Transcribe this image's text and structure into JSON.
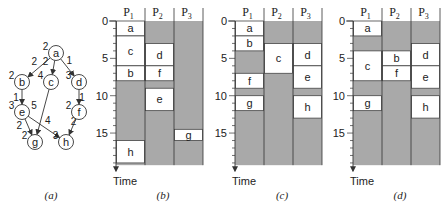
{
  "graph": {
    "caption": "(a)",
    "nodes": [
      {
        "id": "a",
        "weight": "2",
        "x": 56,
        "y": 53
      },
      {
        "id": "b",
        "weight": "2",
        "x": 22,
        "y": 82
      },
      {
        "id": "c",
        "weight": "4",
        "x": 51,
        "y": 82
      },
      {
        "id": "d",
        "weight": "3",
        "x": 79,
        "y": 82
      },
      {
        "id": "e",
        "weight": "3",
        "x": 22,
        "y": 112
      },
      {
        "id": "f",
        "weight": "2",
        "x": 79,
        "y": 112
      },
      {
        "id": "g",
        "weight": "2",
        "x": 35,
        "y": 142
      },
      {
        "id": "h",
        "weight": "3",
        "x": 66,
        "y": 142
      }
    ],
    "edges": [
      {
        "from": "a",
        "to": "b",
        "weight": "2"
      },
      {
        "from": "a",
        "to": "c",
        "weight": "2"
      },
      {
        "from": "a",
        "to": "d",
        "weight": "1"
      },
      {
        "from": "b",
        "to": "e",
        "weight": "1"
      },
      {
        "from": "d",
        "to": "f",
        "weight": "1"
      },
      {
        "from": "c",
        "to": "g",
        "weight": "5"
      },
      {
        "from": "e",
        "to": "g",
        "weight": "2"
      },
      {
        "from": "e",
        "to": "h",
        "weight": "4"
      },
      {
        "from": "f",
        "to": "h",
        "weight": "2"
      }
    ]
  },
  "axis": {
    "label": "Time",
    "ticks": [
      "0",
      "5",
      "10",
      "15"
    ],
    "max_time": 19.3
  },
  "processors": [
    "P1",
    "P2",
    "P3"
  ],
  "schedules": [
    {
      "caption": "(b)",
      "tasks": [
        {
          "name": "a",
          "proc": 0,
          "start": 0,
          "end": 2
        },
        {
          "name": "c",
          "proc": 0,
          "start": 2,
          "end": 6
        },
        {
          "name": "b",
          "proc": 0,
          "start": 6,
          "end": 8
        },
        {
          "name": "h",
          "proc": 0,
          "start": 16,
          "end": 19
        },
        {
          "name": "d",
          "proc": 1,
          "start": 3,
          "end": 6
        },
        {
          "name": "f",
          "proc": 1,
          "start": 6,
          "end": 8
        },
        {
          "name": "e",
          "proc": 1,
          "start": 9,
          "end": 12
        },
        {
          "name": "g",
          "proc": 2,
          "start": 14.5,
          "end": 16
        }
      ]
    },
    {
      "caption": "(c)",
      "tasks": [
        {
          "name": "a",
          "proc": 0,
          "start": 0,
          "end": 2
        },
        {
          "name": "b",
          "proc": 0,
          "start": 2,
          "end": 4
        },
        {
          "name": "f",
          "proc": 0,
          "start": 7,
          "end": 9
        },
        {
          "name": "g",
          "proc": 0,
          "start": 10,
          "end": 12
        },
        {
          "name": "c",
          "proc": 1,
          "start": 3,
          "end": 7
        },
        {
          "name": "d",
          "proc": 2,
          "start": 3,
          "end": 6
        },
        {
          "name": "e",
          "proc": 2,
          "start": 6,
          "end": 9
        },
        {
          "name": "h",
          "proc": 2,
          "start": 10,
          "end": 13
        }
      ]
    },
    {
      "caption": "(d)",
      "tasks": [
        {
          "name": "a",
          "proc": 0,
          "start": 0,
          "end": 2
        },
        {
          "name": "c",
          "proc": 0,
          "start": 4,
          "end": 8
        },
        {
          "name": "g",
          "proc": 0,
          "start": 10,
          "end": 12
        },
        {
          "name": "b",
          "proc": 1,
          "start": 4,
          "end": 6
        },
        {
          "name": "f",
          "proc": 1,
          "start": 6,
          "end": 8
        },
        {
          "name": "d",
          "proc": 2,
          "start": 3,
          "end": 6
        },
        {
          "name": "e",
          "proc": 2,
          "start": 6,
          "end": 9
        },
        {
          "name": "h",
          "proc": 2,
          "start": 10,
          "end": 13
        }
      ]
    }
  ],
  "colors": {
    "idle": "#a9a9a9",
    "task": "#ffffff",
    "line": "#333333"
  }
}
